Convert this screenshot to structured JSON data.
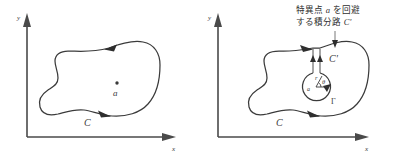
{
  "figure": {
    "background_color": "#ffffff",
    "ink_color": "#3b3b3b",
    "axis_color": "#4a4a4a"
  },
  "panels": [
    {
      "id": "left",
      "name": "simple-closed-contour",
      "axes": {
        "x_label": "x",
        "y_label": "y"
      },
      "contour_label": "C",
      "point_label": "a",
      "point_marker": "dot",
      "arrow_count": 2,
      "orientation": "counterclockwise"
    },
    {
      "id": "right",
      "name": "indented-contour-avoiding-singularity",
      "axes": {
        "x_label": "x",
        "y_label": "y"
      },
      "contour_label": "C",
      "point_label": "a",
      "small_circle_label": "Γ",
      "radius_label": "r",
      "angle_label": "θ",
      "corridor_label": "C'",
      "annotation": {
        "line1_pre": "特異点 ",
        "line1_var": "a",
        "line1_post": " を回避",
        "line2_pre": "する積分路 ",
        "line2_var": "C'",
        "full_text": "特異点 a を回避する積分路 C'"
      }
    }
  ]
}
